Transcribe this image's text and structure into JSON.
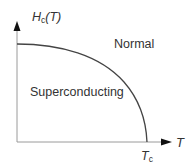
{
  "diagram": {
    "type": "phase-diagram",
    "y_axis": {
      "label_main": "H",
      "label_sub": "c",
      "label_suffix": "(T)"
    },
    "x_axis": {
      "label": "T"
    },
    "tick": {
      "label_main": "T",
      "label_sub": "c"
    },
    "regions": {
      "upper": "Normal",
      "lower": "Superconducting"
    },
    "colors": {
      "axis": "#9a9a9a",
      "curve": "#444444",
      "text": "#333333"
    }
  }
}
